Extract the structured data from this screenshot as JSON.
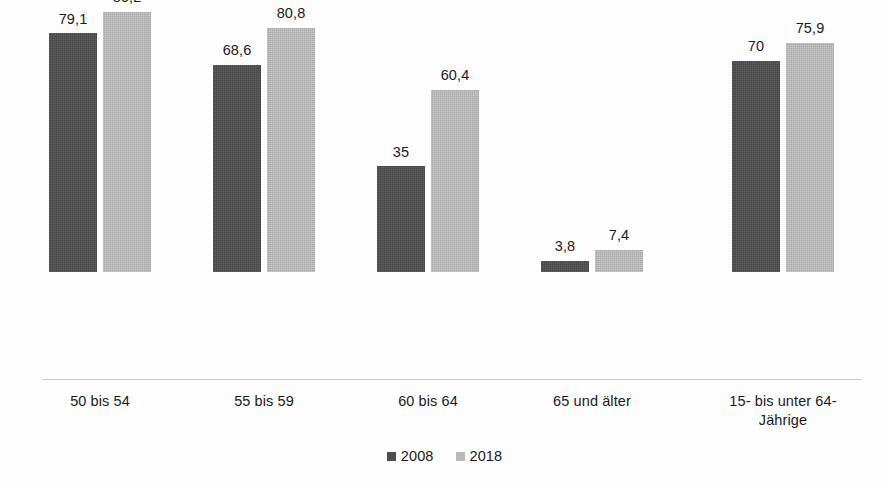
{
  "chart_data": {
    "type": "bar",
    "title": "",
    "subtitle": "",
    "xlabel": "",
    "ylabel": "",
    "ylim": [
      0,
      100
    ],
    "grid": false,
    "legend_position": "bottom",
    "value_decimal_separator": ",",
    "categories": [
      "50 bis 54",
      "55 bis 59",
      "60 bis 64",
      "65 und älter",
      "15- bis unter 64-\nJährige"
    ],
    "category_lines": [
      [
        "50 bis 54"
      ],
      [
        "55 bis 59"
      ],
      [
        "60 bis 64"
      ],
      [
        "65 und älter"
      ],
      [
        "15- bis unter 64-",
        "Jährige"
      ]
    ],
    "series": [
      {
        "name": "2008",
        "color": "#4d4d4d",
        "values": [
          79.1,
          68.6,
          35,
          3.8,
          70
        ],
        "labels": [
          "79,1",
          "68,6",
          "35",
          "3,8",
          "70"
        ]
      },
      {
        "name": "2018",
        "color": "#b9b9b9",
        "values": [
          86.2,
          80.8,
          60.4,
          7.4,
          75.9
        ],
        "labels": [
          "86,2",
          "80,8",
          "60,4",
          "7,4",
          "75,9"
        ]
      }
    ]
  },
  "legend": {
    "items": [
      {
        "label": "2008",
        "color": "#4d4d4d"
      },
      {
        "label": "2018",
        "color": "#b9b9b9"
      }
    ]
  },
  "colors": {
    "series_2008": "#4d4d4d",
    "series_2018": "#b9b9b9",
    "background": "#fdfdfd",
    "baseline": "#c9c9c9",
    "text": "#1a1a1a"
  }
}
